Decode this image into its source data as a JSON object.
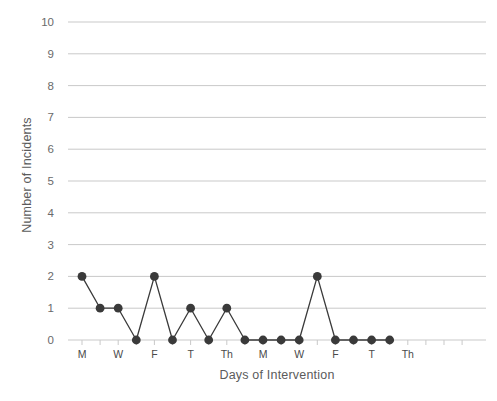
{
  "chart_data": {
    "type": "line",
    "title": "",
    "xlabel": "Days of Intervention",
    "ylabel": "Number of Incidents",
    "ylim": [
      0,
      10
    ],
    "y_ticks": [
      0,
      1,
      2,
      3,
      4,
      5,
      6,
      7,
      8,
      9,
      10
    ],
    "y_tick_labels": [
      "0",
      "1",
      "2",
      "3",
      "4",
      "5",
      "6",
      "7",
      "8",
      "9",
      "10"
    ],
    "grid": true,
    "legend": false,
    "legend_position": "none",
    "x_index": [
      0,
      1,
      2,
      3,
      4,
      5,
      6,
      7,
      8,
      9,
      10,
      11,
      12,
      13,
      14,
      15,
      16,
      17
    ],
    "x_tick_labels": [
      "M",
      "",
      "W",
      "",
      "F",
      "",
      "T",
      "",
      "Th",
      "",
      "M",
      "",
      "W",
      "",
      "F",
      "",
      "T",
      "",
      "Th",
      "",
      "",
      ""
    ],
    "categories": [
      "M",
      "T",
      "W",
      "Th",
      "F",
      "S",
      "T",
      "W",
      "Th",
      "F",
      "M",
      "T",
      "W",
      "Th",
      "F",
      "S",
      "T",
      "W"
    ],
    "values": [
      2,
      1,
      1,
      0,
      2,
      0,
      1,
      0,
      1,
      0,
      0,
      0,
      0,
      2,
      0,
      0,
      0,
      0
    ],
    "series": [
      {
        "name": "Incidents",
        "values": [
          2,
          1,
          1,
          0,
          2,
          0,
          1,
          0,
          1,
          0,
          0,
          0,
          0,
          2,
          0,
          0,
          0,
          0
        ],
        "color": "#3a3a3a",
        "marker": "circle"
      }
    ],
    "colors": {
      "line": "#3a3a3a",
      "marker": "#3a3a3a",
      "grid": "#c9c9c9",
      "axis_text": "#6a6a6a",
      "title_text": "#5b5b5b",
      "background": "#ffffff"
    }
  }
}
